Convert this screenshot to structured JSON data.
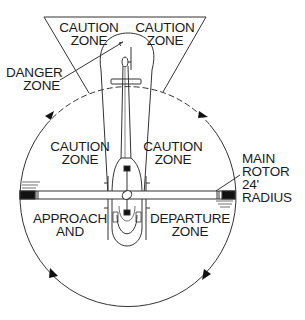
{
  "diagram": {
    "colors": {
      "background": "#ffffff",
      "line": "#333333",
      "text": "#1a1a1a",
      "fill_dark": "#111111"
    },
    "labels": {
      "caution_top_left": [
        "CAUTION",
        "ZONE"
      ],
      "caution_top_right": [
        "CAUTION",
        "ZONE"
      ],
      "danger_zone": [
        "DANGER",
        "ZONE"
      ],
      "caution_mid_left": [
        "CAUTION",
        "ZONE"
      ],
      "caution_mid_right": [
        "CAUTION",
        "ZONE"
      ],
      "main_rotor": [
        "MAIN",
        "ROTOR",
        "24'",
        "RADIUS"
      ],
      "approach": [
        "APPROACH",
        "AND"
      ],
      "departure": [
        "DEPARTURE",
        "ZONE"
      ]
    },
    "icons": {
      "rotation_arrows": "rotation-arrow-icon",
      "helicopter": "helicopter-top-view-icon"
    }
  }
}
